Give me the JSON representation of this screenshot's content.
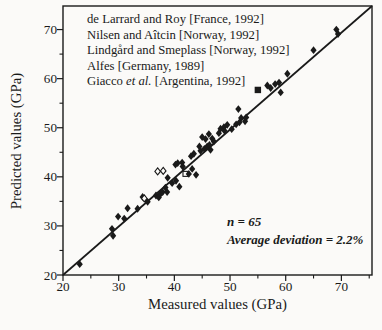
{
  "colors": {
    "ink": "#1a1a1a",
    "background": "#fbfaf8",
    "marker_fill": "#1a1a1a",
    "open_marker_fill": "#fdfcfa"
  },
  "chart_data": {
    "type": "scatter",
    "xlabel": "Measured values (GPa)",
    "ylabel": "Predicted values (GPa)",
    "xlim": [
      20,
      75.5
    ],
    "ylim": [
      20,
      74.8
    ],
    "x_major_ticks": [
      20,
      30,
      40,
      50,
      60,
      70
    ],
    "x_minor_ticks": [
      25,
      35,
      45,
      55,
      65,
      75
    ],
    "y_major_ticks": [
      20,
      30,
      40,
      50,
      60,
      70
    ],
    "y_minor_ticks": [
      25,
      35,
      45,
      55,
      65
    ],
    "grid": false,
    "identity_line": {
      "x": [
        20,
        75.5
      ],
      "y": [
        20,
        74.8
      ],
      "meaning": "y = x equality line"
    },
    "legend_position": "top-left-inside",
    "legend_sources": [
      [
        [
          "de Larrard and Roy [France, 1992]"
        ]
      ],
      [
        [
          "Nilsen and Aîtcin [Norway, 1992]"
        ]
      ],
      [
        [
          "Lindgård and Smeplass [Norway, 1992]"
        ]
      ],
      [
        [
          "Alfes [Germany, 1989]"
        ]
      ],
      [
        [
          "Giacco "
        ],
        [
          "et al.",
          "i"
        ],
        [
          " [Argentina, 1992]"
        ]
      ]
    ],
    "annotations": [
      "n = 65",
      "Average deviation = 2.2%"
    ],
    "n_points": 65,
    "average_deviation_percent": 2.2,
    "marker_types": {
      "d": "filled-diamond",
      "o": "open-diamond",
      "s": "filled-square",
      "q": "open-square"
    },
    "points": [
      [
        23.0,
        22.2,
        "d"
      ],
      [
        28.8,
        29.4,
        "d"
      ],
      [
        29.0,
        28.0,
        "d"
      ],
      [
        29.9,
        31.9,
        "d"
      ],
      [
        31.0,
        31.5,
        "d"
      ],
      [
        31.6,
        33.6,
        "d"
      ],
      [
        33.4,
        33.5,
        "d"
      ],
      [
        34.3,
        35.9,
        "d"
      ],
      [
        34.6,
        35.6,
        "o"
      ],
      [
        35.2,
        34.9,
        "d"
      ],
      [
        36.7,
        36.2,
        "d"
      ],
      [
        37.2,
        35.8,
        "d"
      ],
      [
        37.5,
        36.5,
        "d"
      ],
      [
        37.9,
        36.9,
        "d"
      ],
      [
        38.4,
        37.8,
        "d"
      ],
      [
        38.7,
        36.9,
        "d"
      ],
      [
        38.8,
        39.8,
        "d"
      ],
      [
        39.6,
        38.7,
        "d"
      ],
      [
        40.3,
        39.2,
        "d"
      ],
      [
        40.9,
        38.0,
        "d"
      ],
      [
        37.0,
        41.1,
        "o"
      ],
      [
        38.0,
        41.2,
        "o"
      ],
      [
        40.2,
        42.5,
        "d"
      ],
      [
        40.6,
        42.8,
        "d"
      ],
      [
        41.4,
        42.9,
        "d"
      ],
      [
        41.5,
        42.1,
        "d"
      ],
      [
        42.0,
        40.6,
        "q"
      ],
      [
        42.6,
        40.6,
        "d"
      ],
      [
        43.2,
        41.6,
        "d"
      ],
      [
        43.9,
        40.4,
        "d"
      ],
      [
        43.0,
        44.2,
        "d"
      ],
      [
        43.5,
        44.7,
        "d"
      ],
      [
        44.5,
        46.2,
        "d"
      ],
      [
        44.7,
        45.3,
        "d"
      ],
      [
        45.4,
        45.7,
        "d"
      ],
      [
        45.6,
        47.7,
        "d"
      ],
      [
        45.9,
        46.2,
        "d"
      ],
      [
        46.3,
        46.5,
        "d"
      ],
      [
        46.5,
        45.5,
        "d"
      ],
      [
        46.8,
        47.8,
        "d"
      ],
      [
        45.0,
        48.1,
        "d"
      ],
      [
        46.2,
        48.7,
        "d"
      ],
      [
        47.1,
        47.2,
        "d"
      ],
      [
        48.0,
        48.9,
        "d"
      ],
      [
        48.3,
        49.8,
        "d"
      ],
      [
        48.9,
        50.1,
        "d"
      ],
      [
        49.5,
        50.6,
        "d"
      ],
      [
        49.0,
        49.4,
        "d"
      ],
      [
        50.3,
        49.7,
        "d"
      ],
      [
        51.1,
        50.7,
        "d"
      ],
      [
        51.5,
        53.8,
        "d"
      ],
      [
        51.7,
        51.1,
        "d"
      ],
      [
        52.0,
        52.0,
        "d"
      ],
      [
        52.7,
        51.3,
        "d"
      ],
      [
        52.9,
        52.1,
        "d"
      ],
      [
        55.0,
        57.7,
        "s"
      ],
      [
        56.7,
        58.6,
        "d"
      ],
      [
        57.3,
        58.1,
        "d"
      ],
      [
        58.1,
        58.9,
        "d"
      ],
      [
        58.8,
        59.2,
        "d"
      ],
      [
        59.1,
        57.2,
        "d"
      ],
      [
        60.3,
        61.0,
        "d"
      ],
      [
        65.0,
        65.8,
        "d"
      ],
      [
        69.1,
        70.0,
        "d"
      ],
      [
        69.4,
        69.1,
        "d"
      ]
    ]
  }
}
